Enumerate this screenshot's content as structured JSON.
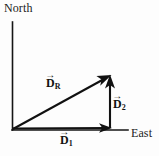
{
  "figure": {
    "background_color": "#fdfdfd",
    "ink_color": "#121212",
    "axes": {
      "vertical_label": "North",
      "horizontal_label": "East",
      "origin": {
        "x": 12,
        "y": 130
      },
      "vertical_top": {
        "x": 12,
        "y": 22
      },
      "horizontal_right": {
        "x": 128,
        "y": 130
      }
    },
    "vectors": [
      {
        "name": "D1",
        "symbol": "D",
        "subscript": "1",
        "accent": "arrow",
        "label_text": "D",
        "description": "eastward displacement along horizontal axis",
        "from": {
          "x": 12,
          "y": 129
        },
        "to": {
          "x": 110,
          "y": 128
        },
        "direction": "east"
      },
      {
        "name": "D2",
        "symbol": "D",
        "subscript": "2",
        "accent": "arrow",
        "label_text": "D",
        "description": "northward displacement, vertical segment",
        "from": {
          "x": 110,
          "y": 128
        },
        "to": {
          "x": 110,
          "y": 76
        },
        "direction": "north"
      },
      {
        "name": "DR",
        "symbol": "D",
        "subscript": "R",
        "accent": "arrow",
        "label_text": "D",
        "description": "resultant vector from origin to tip of D2",
        "from": {
          "x": 13,
          "y": 129
        },
        "to": {
          "x": 110,
          "y": 76
        },
        "direction": "northeast"
      }
    ],
    "arrow_glyph": "→"
  }
}
